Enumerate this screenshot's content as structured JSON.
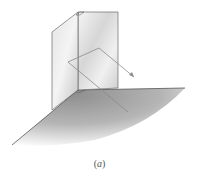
{
  "figure": {
    "caption_open": "(",
    "caption_letter": "a",
    "caption_close": ")",
    "colors": {
      "plane_light": "#f2f2f2",
      "plane_mid": "#c8c8c8",
      "plane_dark": "#8c8c8c",
      "edge": "#555555",
      "vector": "#8a8a8a"
    }
  }
}
